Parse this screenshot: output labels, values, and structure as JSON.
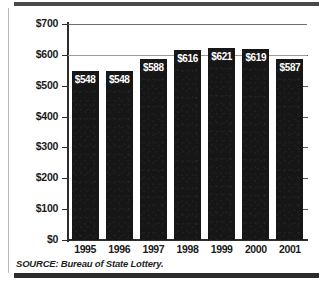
{
  "figure": {
    "source_note": "SOURCE: Bureau of State Lottery.",
    "frame_color": "#2b2b2b",
    "bar_color": "#161616",
    "grid_color": "#9a9a9a",
    "label_color": "#ffffff"
  },
  "chart_data": {
    "type": "bar",
    "title": "",
    "subtitle": "",
    "xlabel": "",
    "ylabel": "Millions",
    "categories": [
      "1995",
      "1996",
      "1997",
      "1998",
      "1999",
      "2000",
      "2001"
    ],
    "values": [
      548,
      548,
      588,
      616,
      621,
      619,
      587
    ],
    "data_labels": [
      "$548",
      "$548",
      "$588",
      "$616",
      "$621",
      "$619",
      "$587"
    ],
    "ylim": [
      0,
      700
    ],
    "ytick_values": [
      0,
      100,
      200,
      300,
      400,
      500,
      600,
      700
    ],
    "ytick_labels": [
      "$0",
      "$100",
      "$200",
      "$300",
      "$400",
      "$500",
      "$600",
      "$700"
    ],
    "grid": true,
    "gridlines_drawn_at": [
      600,
      700
    ],
    "legend": null,
    "legend_position": "none",
    "units": "Millions of dollars",
    "annotations": []
  }
}
